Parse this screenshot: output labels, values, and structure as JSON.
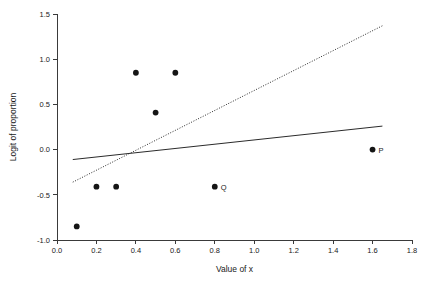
{
  "chart_data": {
    "type": "scatter",
    "title": "",
    "xlabel": "Value of x",
    "ylabel": "Logit of proportion",
    "xlim": [
      0.0,
      1.8
    ],
    "ylim": [
      -1.0,
      1.5
    ],
    "grid": false,
    "legend": "none",
    "xticks": [
      "0.0",
      "0.2",
      "0.4",
      "0.6",
      "0.8",
      "1.0",
      "1.2",
      "1.4",
      "1.6",
      "1.8"
    ],
    "xtick_values": [
      0.0,
      0.2,
      0.4,
      0.6,
      0.8,
      1.0,
      1.2,
      1.4,
      1.6,
      1.8
    ],
    "yticks": [
      "1.5",
      "1.0",
      "0.5",
      "0.0",
      "-0.5",
      "-1.0"
    ],
    "ytick_values": [
      1.5,
      1.0,
      0.5,
      0.0,
      -0.5,
      -1.0
    ],
    "points": [
      {
        "x": 0.1,
        "y": -0.85,
        "label": ""
      },
      {
        "x": 0.2,
        "y": -0.41,
        "label": ""
      },
      {
        "x": 0.3,
        "y": -0.41,
        "label": ""
      },
      {
        "x": 0.4,
        "y": 0.85,
        "label": ""
      },
      {
        "x": 0.5,
        "y": 0.41,
        "label": ""
      },
      {
        "x": 0.6,
        "y": 0.85,
        "label": ""
      },
      {
        "x": 0.8,
        "y": -0.41,
        "label": "Q"
      },
      {
        "x": 1.6,
        "y": 0.0,
        "label": "P"
      }
    ],
    "series": [
      {
        "name": "solid fit line",
        "style": "solid",
        "x": [
          0.08,
          1.65
        ],
        "values": [
          -0.11,
          0.26
        ]
      },
      {
        "name": "dotted fit line",
        "style": "dotted",
        "x": [
          0.08,
          1.65
        ],
        "values": [
          -0.36,
          1.37
        ]
      }
    ],
    "annotations": [
      {
        "text": "P",
        "x": 1.6,
        "y": 0.0
      },
      {
        "text": "Q",
        "x": 0.8,
        "y": -0.41
      }
    ],
    "colors": {
      "point": "#151515",
      "line": "#2b2b2b",
      "axis": "#3a3a3a",
      "background": "#ffffff"
    }
  }
}
